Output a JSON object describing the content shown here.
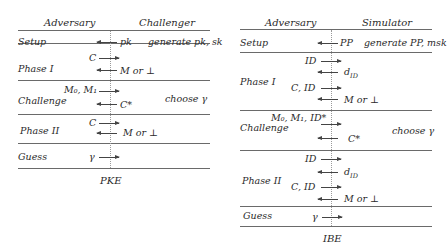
{
  "pke": {
    "caption": "PKE",
    "header": {
      "left": "Adversary",
      "right": "Challenger"
    },
    "phases": {
      "setup": {
        "label": "Setup",
        "to_adv": "pk",
        "note": "generate pk,  sk"
      },
      "phase1": {
        "label": "Phase I",
        "to_ch": "C",
        "to_adv": "M or  ⊥"
      },
      "challenge": {
        "label": "Challenge",
        "to_ch": "M₀, M₁",
        "to_adv": "C*",
        "note": "choose γ"
      },
      "phase2": {
        "label": "Phase II",
        "to_ch": "C",
        "to_adv": "M or  ⊥"
      },
      "guess": {
        "label": "Guess",
        "to_ch": "γ"
      }
    }
  },
  "ibe": {
    "caption": "IBE",
    "header": {
      "left": "Adversary",
      "right": "Simulator"
    },
    "phases": {
      "setup": {
        "label": "Setup",
        "to_adv": "PP",
        "note": "generate PP,  msk"
      },
      "phase1": {
        "label": "Phase I",
        "q1": "ID",
        "r1": "d",
        "r1_sub": "ID",
        "q2": "C,  ID",
        "r2": "M or  ⊥"
      },
      "challenge": {
        "label": "Challenge",
        "to_ch": "M₀,  M₁, ID*",
        "to_adv": "C*",
        "note": "choose γ"
      },
      "phase2": {
        "label": "Phase II",
        "q1": "ID",
        "r1": "d",
        "r1_sub": "ID",
        "q2": "C,  ID",
        "r2": "M or  ⊥"
      },
      "guess": {
        "label": "Guess",
        "to_ch": "γ"
      }
    }
  }
}
